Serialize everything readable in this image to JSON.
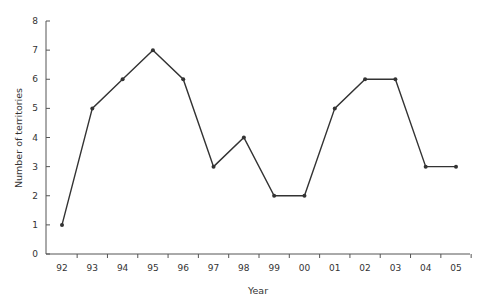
{
  "chart_data": {
    "type": "line",
    "title": "",
    "xlabel": "Year",
    "ylabel": "Number of territories",
    "categories": [
      "92",
      "93",
      "94",
      "95",
      "96",
      "97",
      "98",
      "99",
      "00",
      "01",
      "02",
      "03",
      "04",
      "05"
    ],
    "series": [
      {
        "name": "Number of territories",
        "values": [
          1,
          5,
          6,
          7,
          6,
          3,
          4,
          2,
          2,
          5,
          6,
          6,
          3,
          3
        ]
      }
    ],
    "yticks": [
      0,
      1,
      2,
      3,
      4,
      5,
      6,
      7,
      8
    ],
    "ylim": [
      0,
      8
    ],
    "grid": false,
    "legend": null,
    "colors": {
      "line": "#333333",
      "axis": "#555555",
      "text": "#333333"
    }
  }
}
